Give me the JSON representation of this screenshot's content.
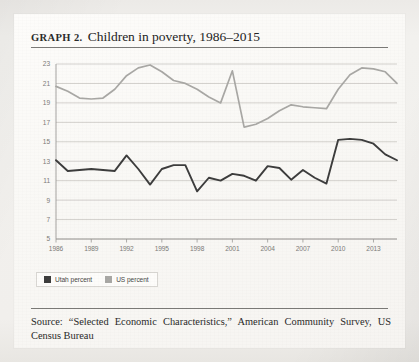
{
  "figure": {
    "label": "GRAPH 2.",
    "title": "Children in poverty, 1986–2015",
    "source": "Source: “Selected Economic Characteristics,” American Community Survey, US Census Bureau"
  },
  "legend": {
    "position": "below-plot-left",
    "items": [
      {
        "label": "Utah percent",
        "color": "#3d3d3d"
      },
      {
        "label": "US percent",
        "color": "#a9a8a5"
      }
    ]
  },
  "chart_data": {
    "type": "line",
    "title": "Children in poverty, 1986–2015",
    "xlabel": "",
    "ylabel": "",
    "grid": true,
    "xlim": [
      1986,
      2015
    ],
    "ylim": [
      5,
      23
    ],
    "yticks": [
      5,
      7,
      9,
      11,
      13,
      15,
      17,
      19,
      21,
      23
    ],
    "xticks": [
      1986,
      1989,
      1992,
      1995,
      1998,
      2001,
      2004,
      2007,
      2010,
      2013
    ],
    "x": [
      1986,
      1987,
      1988,
      1989,
      1990,
      1991,
      1992,
      1993,
      1994,
      1995,
      1996,
      1997,
      1998,
      1999,
      2000,
      2001,
      2002,
      2003,
      2004,
      2005,
      2006,
      2007,
      2008,
      2009,
      2010,
      2011,
      2012,
      2013,
      2014,
      2015
    ],
    "series": [
      {
        "name": "Utah percent",
        "color": "#3d3d3d",
        "values": [
          13.1,
          12.0,
          12.1,
          12.2,
          12.1,
          12.0,
          13.6,
          12.2,
          10.6,
          12.2,
          12.6,
          12.6,
          9.9,
          11.3,
          11.0,
          11.7,
          11.5,
          11.0,
          12.5,
          12.3,
          11.1,
          12.1,
          11.3,
          10.7,
          15.2,
          15.3,
          15.2,
          14.8,
          13.7,
          13.1
        ]
      },
      {
        "name": "US percent",
        "color": "#a9a8a5",
        "values": [
          20.7,
          20.2,
          19.5,
          19.4,
          19.5,
          20.4,
          21.8,
          22.6,
          22.9,
          22.2,
          21.3,
          21.0,
          20.4,
          19.6,
          19.0,
          22.3,
          16.5,
          16.8,
          17.4,
          18.2,
          18.8,
          18.6,
          18.5,
          18.4,
          20.4,
          21.9,
          22.6,
          22.5,
          22.2,
          21.0
        ]
      }
    ]
  },
  "colors": {
    "grid": "#c9c7c3",
    "axis": "#9b9996",
    "tick_text": "#7c7b78",
    "rule": "#7b7a77",
    "card_bg": "#fbfaf8",
    "page_bg": "#eeedea"
  }
}
